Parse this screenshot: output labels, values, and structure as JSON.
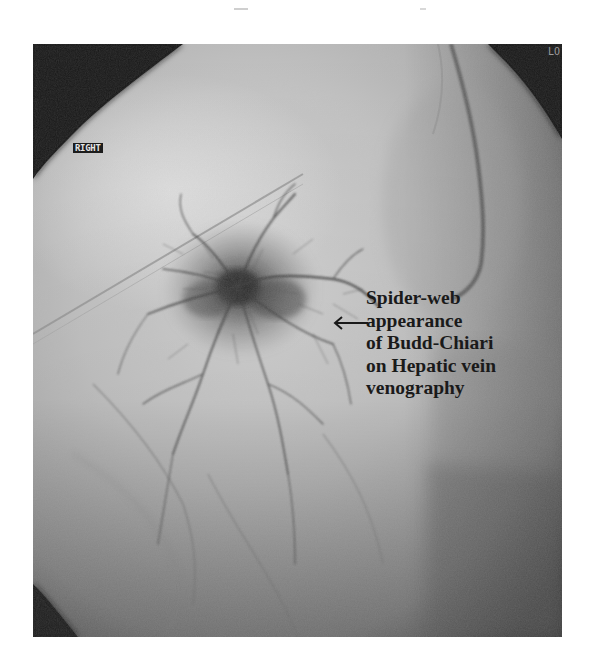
{
  "figure": {
    "type": "fluoroscopic hepatic venogram",
    "orientation_marker": "RIGHT",
    "corner_marker": "LO",
    "annotation": {
      "lines": [
        "Spider-web",
        "appearance",
        "of Budd-Chiari",
        "on Hepatic vein",
        "venography"
      ],
      "arrow_icon": "left-arrow",
      "text_color": "#1a1a1a"
    },
    "colors": {
      "background": "#ffffff",
      "collimator_shadow": "#141414",
      "field": "#bdbdbd",
      "contrast_web": "#3a3a3a"
    }
  }
}
